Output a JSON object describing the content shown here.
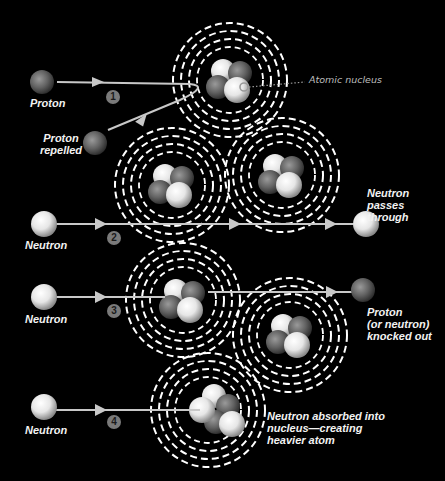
{
  "diagram": {
    "colors": {
      "background": "#000000",
      "neutron": "#f0f0f0",
      "proton": "#6e6e6e",
      "orbit_rings": "#ffffff",
      "path_line": "#c8c8c8",
      "step_badge": "#7a7a7a",
      "label_text": "#f2f2f2"
    },
    "callout": {
      "label": "Atomic nucleus"
    },
    "steps": [
      {
        "number": "1",
        "incoming_particle": "Proton",
        "incoming_label": "Proton",
        "outcome_label": "Proton\nrepelled"
      },
      {
        "number": "2",
        "incoming_particle": "Neutron",
        "incoming_label": "Neutron",
        "outcome_label": "Neutron\npasses through"
      },
      {
        "number": "3",
        "incoming_particle": "Neutron",
        "incoming_label": "Neutron",
        "outcome_label": "Proton\n(or neutron)\nknocked out"
      },
      {
        "number": "4",
        "incoming_particle": "Neutron",
        "incoming_label": "Neutron",
        "outcome_label": "Neutron absorbed into\nnucleus—creating\nheavier atom"
      }
    ],
    "atoms": [
      {
        "id": "atom-1",
        "cx": 230,
        "cy": 80
      },
      {
        "id": "atom-2a",
        "cx": 172,
        "cy": 185
      },
      {
        "id": "atom-2b",
        "cx": 282,
        "cy": 175
      },
      {
        "id": "atom-3a",
        "cx": 183,
        "cy": 300
      },
      {
        "id": "atom-3b",
        "cx": 290,
        "cy": 335
      },
      {
        "id": "atom-4",
        "cx": 208,
        "cy": 410
      }
    ]
  }
}
